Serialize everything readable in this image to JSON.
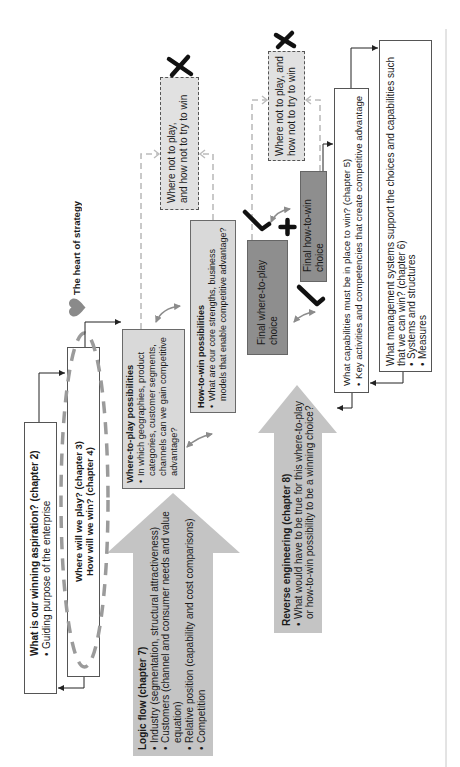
{
  "colors": {
    "text": "#1a1a1a",
    "box_border": "#555555",
    "possibility_fill": "#d9d9d9",
    "final_choice_fill": "#8e8e8e",
    "big_arrow_fill": "#c4c4c4",
    "where_not_fill": "#e1e1e1",
    "dashed_connector": "#bcbcbc",
    "ellipse_dash": "#9b9b9b",
    "double_arrow": "#8c8c8c",
    "heart": "#8a8a8a",
    "mark": "#111111",
    "connector": "#222222",
    "divider": "#c8c8c8"
  },
  "icons": {
    "heart": "heart-icon",
    "reject": "x-mark-icon",
    "accept": "check-mark-icon",
    "combine": "plus-icon"
  },
  "aspiration": {
    "title": "What is our winning aspiration? (chapter 2)",
    "bullets": [
      "Guiding purpose of the enterprise"
    ]
  },
  "where_how": {
    "lines": [
      "Where will we play? (chapter 3)",
      "How will we win? (chapter 4)"
    ]
  },
  "heart": {
    "label": "The heart of strategy"
  },
  "where_to_play_possibilities": {
    "title": "Where-to-play possibilities",
    "bullets": [
      "In which geographies, product categories, customer segments, channels can we gain competitive advantage?"
    ]
  },
  "how_to_win_possibilities": {
    "title": "How-to-win possibilities",
    "bullets": [
      "What are our core strengths, business models that enable competitive advantage?"
    ]
  },
  "where_not_1": {
    "lines": [
      "Where not to play,",
      "and how not to try to win"
    ]
  },
  "where_not_2": {
    "lines": [
      "Where not to play, and",
      "how not to try to win"
    ]
  },
  "final_where_to_play": {
    "lines": [
      "Final where-to-play",
      "choice"
    ]
  },
  "final_how_to_win": {
    "lines": [
      "Final how-to-win",
      "choice"
    ]
  },
  "logic_flow": {
    "title": "Logic flow (chapter 7)",
    "bullets": [
      "Industry (segmentation, structural attractiveness)",
      "Customers (channel and consumer needs and value equation)",
      "Relative position (capability and cost comparisons)",
      "Competition"
    ]
  },
  "reverse_engineering": {
    "title": "Reverse engineering (chapter 8)",
    "bullets": [
      "What would have to be true for this where-to-play or how-to-win possibility to be a winning choice?"
    ]
  },
  "capabilities": {
    "title": "What capabilities must be in place to win? (chapter 5)",
    "bullets": [
      "Key activities and competencies that create competitive advantage"
    ]
  },
  "management_systems": {
    "title": "What management systems support the choices and capabilities such that we can win? (chapter 6)",
    "bullets": [
      "Systems and structures",
      "Measures"
    ]
  }
}
